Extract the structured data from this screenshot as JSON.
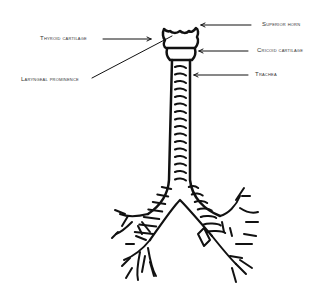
{
  "labels": {
    "superior_horn": "Superior horn",
    "thyroid_cartilage": "Thyroid cartilage",
    "cricoid_cartilage": "Cricoid cartilage",
    "laryngeal_prominence": "Laryngeal prominence",
    "trachea": "Trachea"
  },
  "colors": {
    "stroke": "#111111",
    "label": "#333333",
    "background": "#ffffff"
  }
}
